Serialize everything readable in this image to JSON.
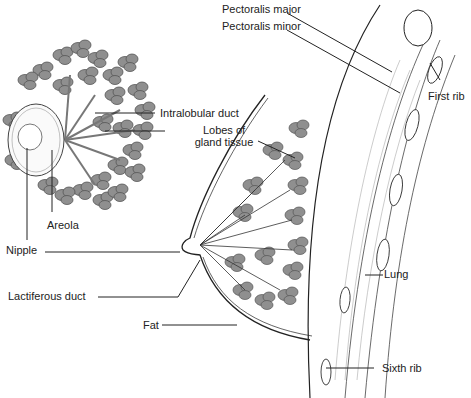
{
  "diagram": {
    "colors": {
      "lobe_fill": "#8f8f8f",
      "lobe_stroke": "#555555",
      "line": "#222222",
      "text": "#222222",
      "background": "#ffffff"
    },
    "labels": {
      "pectoralis_major": "Pectoralis major",
      "pectoralis_minor": "Pectoralis minor",
      "first_rib": "First rib",
      "intralobular_duct": "Intralobular duct",
      "lobes_line1": "Lobes of",
      "lobes_line2": "gland tissue",
      "areola": "Areola",
      "nipple": "Nipple",
      "lactiferous_duct": "Lactiferous duct",
      "lung": "Lung",
      "fat": "Fat",
      "sixth_rib": "Sixth rib"
    }
  }
}
